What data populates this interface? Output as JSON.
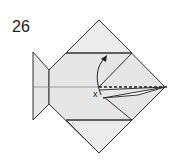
{
  "diagram": {
    "step_number": "26",
    "marks": {
      "x_label": "x"
    },
    "colors": {
      "paper_fill": "#e6e6e6",
      "line": "#333333",
      "center_line": "#888888"
    },
    "symbols": [
      "valley-fold-dashed-line",
      "curved-arrow-up",
      "x-reference-mark"
    ]
  }
}
